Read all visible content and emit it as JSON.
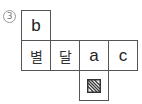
{
  "label": "3",
  "net": {
    "top": {
      "text": "b"
    },
    "row": [
      {
        "text": "별"
      },
      {
        "text": "달"
      },
      {
        "text": "a"
      },
      {
        "text": "c"
      }
    ],
    "bottom": {
      "icon": "hatched-square-icon"
    }
  },
  "colors": {
    "border": "#555555",
    "text": "#222222",
    "label": "#777777"
  }
}
